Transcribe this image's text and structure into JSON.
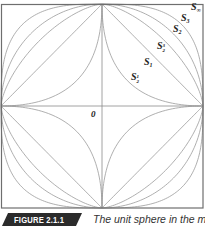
{
  "figure": {
    "label": "FIGURE 2.1.1",
    "caption": "The unit sphere in the metric",
    "origin_label": "0",
    "colors": {
      "curve": "#9a9a9a",
      "frame": "#6e6e6e",
      "banner": "#2b2b2b"
    }
  },
  "chart_data": {
    "type": "diagram",
    "center": [
      102,
      106
    ],
    "half_extent": [
      101,
      102
    ],
    "curves": [
      {
        "p": 0.5,
        "label": "S",
        "sub": "1/2"
      },
      {
        "p": 1,
        "label": "S",
        "sub": "1"
      },
      {
        "p": 1.5,
        "label": "S",
        "sub": "3/2"
      },
      {
        "p": 2,
        "label": "S",
        "sub": "2"
      },
      {
        "p": 3,
        "label": "S",
        "sub": "3"
      },
      {
        "p": "infinity",
        "label": "S",
        "sub": "∞"
      }
    ],
    "axes": {
      "x": true,
      "y": true
    }
  },
  "labels": {
    "s_inf": {
      "base": "S",
      "sub": "∞"
    },
    "s_3": {
      "base": "S",
      "sub": "3"
    },
    "s_2": {
      "base": "S",
      "sub": "2"
    },
    "s_3_2": {
      "base": "S",
      "num": "3",
      "den": "2"
    },
    "s_1": {
      "base": "S",
      "sub": "1"
    },
    "s_1_2": {
      "base": "S",
      "num": "1",
      "den": "2"
    }
  }
}
